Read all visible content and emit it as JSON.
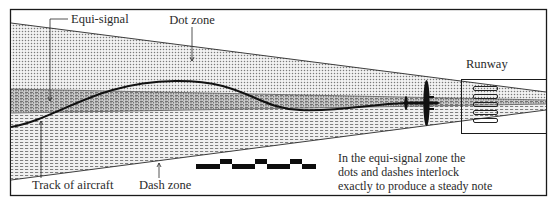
{
  "diagram": {
    "type": "radio-range beam approach diagram",
    "labels": {
      "equi_signal": "Equi-signal",
      "dot_zone": "Dot zone",
      "runway": "Runway",
      "track_of_aircraft": "Track of aircraft",
      "dash_zone": "Dash zone",
      "note_line1": "In the equi-signal zone the",
      "note_line2": "dots and dashes interlock",
      "note_line3": "exactly to produce a steady note"
    },
    "zones": [
      {
        "name": "Dot zone",
        "pattern": "dots"
      },
      {
        "name": "Equi-signal",
        "pattern": "dots+dashes overlap"
      },
      {
        "name": "Dash zone",
        "pattern": "dashes"
      }
    ],
    "elements": [
      "beam cone",
      "aircraft track",
      "aircraft silhouette",
      "runway with markings",
      "interlocking signal waveform"
    ],
    "colors": {
      "line": "#1a1a1a",
      "background": "#ffffff",
      "pattern": "#8a8a8a"
    }
  }
}
